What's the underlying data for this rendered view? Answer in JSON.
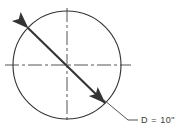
{
  "figure": {
    "background_color": "#ffffff",
    "line_color": "#333333",
    "centerline_color": "#555555",
    "text_color": "#3b3b3b"
  },
  "circle": {
    "name": "circle-outline",
    "center_x": 67,
    "center_y": 65,
    "radius": 54
  },
  "centerlines": {
    "horizontal": {
      "x1": 5,
      "y1": 65,
      "x2": 131,
      "y2": 65
    },
    "vertical": {
      "x1": 67,
      "y1": 8,
      "x2": 67,
      "y2": 123
    },
    "dash_pattern": "14 3 3 3"
  },
  "diameter_arrow": {
    "name": "diameter-double-arrow",
    "x1": 28,
    "y1": 28,
    "x2": 105,
    "y2": 103,
    "arrowheads": "both"
  },
  "leader": {
    "elbow_x": 128,
    "elbow_y": 120,
    "start_x": 104,
    "start_y": 100,
    "end_x": 138,
    "end_y": 120
  },
  "label": {
    "name": "diameter-label",
    "text": "D  =  10\"",
    "symbol": "D",
    "equals": "=",
    "value": "10",
    "unit": "\"",
    "x": 141,
    "y": 123
  }
}
